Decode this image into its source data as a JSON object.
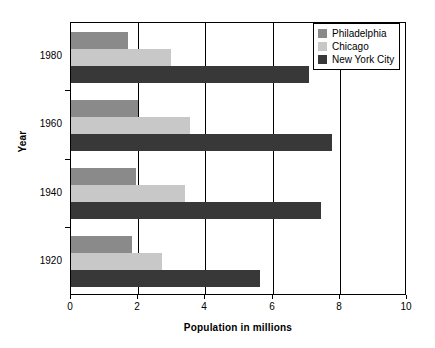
{
  "chart_data": {
    "type": "bar",
    "orientation": "horizontal",
    "title": "",
    "xlabel": "Population in millions",
    "ylabel": "Year",
    "categories": [
      "1980",
      "1960",
      "1940",
      "1920"
    ],
    "xlim": [
      0,
      10
    ],
    "xticks": [
      "0",
      "2",
      "4",
      "6",
      "8",
      "10"
    ],
    "grid": "vertical",
    "legend_position": "top-right-inside",
    "series": [
      {
        "name": "Philadelphia",
        "color": "#8a8a8a",
        "values": [
          1.69,
          2.0,
          1.93,
          1.82
        ]
      },
      {
        "name": "Chicago",
        "color": "#c8c8c8",
        "values": [
          2.99,
          3.55,
          3.4,
          2.7
        ]
      },
      {
        "name": "New York City",
        "color": "#383838",
        "values": [
          7.07,
          7.78,
          7.45,
          5.62
        ]
      }
    ]
  },
  "figure": {
    "background": "#ffffff",
    "axis_color": "#000000"
  }
}
